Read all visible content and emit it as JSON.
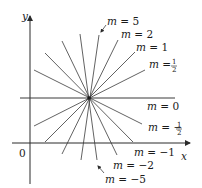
{
  "figure": {
    "axes": {
      "x_label": "x",
      "y_label": "y",
      "origin_label": "0"
    },
    "center_point": {
      "px": [
        89,
        98
      ]
    },
    "lines": [
      {
        "slope_label": "m = 5",
        "m_text": "m",
        "eq": "=",
        "value": "5"
      },
      {
        "slope_label": "m = 2",
        "m_text": "m",
        "eq": "=",
        "value": "2"
      },
      {
        "slope_label": "m = 1",
        "m_text": "m",
        "eq": "=",
        "value": "1"
      },
      {
        "slope_label": "m = 1/2",
        "m_text": "m",
        "eq": "=",
        "num": "1",
        "den": "2"
      },
      {
        "slope_label": "m = 0",
        "m_text": "m",
        "eq": "=",
        "value": "0"
      },
      {
        "slope_label": "m = -1/2",
        "m_text": "m",
        "eq": "= −",
        "num": "1",
        "den": "2"
      },
      {
        "slope_label": "m = -1",
        "m_text": "m",
        "eq": "=",
        "value": "−1"
      },
      {
        "slope_label": "m = -2",
        "m_text": "m",
        "eq": "=",
        "value": "−2"
      },
      {
        "slope_label": "m = -5",
        "m_text": "m",
        "eq": "=",
        "value": "−5"
      }
    ],
    "slopes_drawn": [
      5,
      2,
      1,
      0.5,
      0,
      -0.5,
      -1,
      -2,
      -5
    ],
    "colors": {
      "line": "#3a3a3a",
      "axis": "#2a2a2a",
      "background": "#ffffff"
    }
  }
}
